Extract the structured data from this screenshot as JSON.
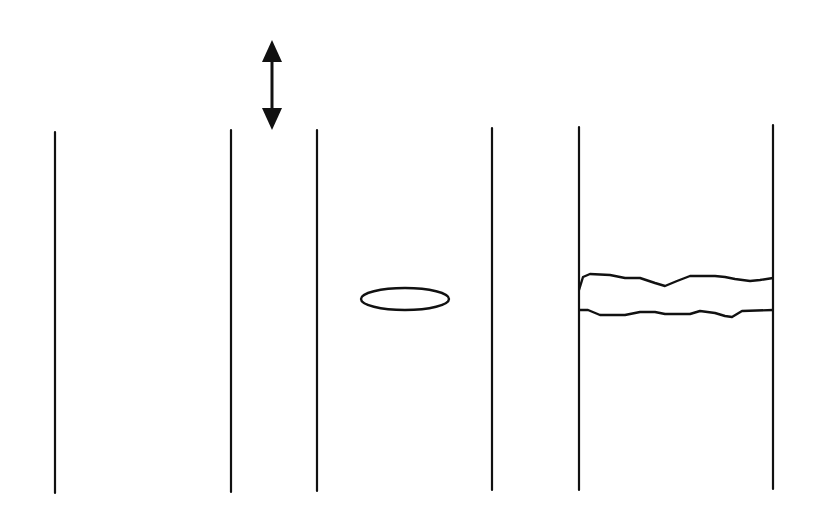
{
  "diagram": {
    "background": "#ffffff",
    "stroke_color": "#111111",
    "panels": [
      {
        "name": "panel-1",
        "left_line": {
          "x": 55,
          "y1": 132,
          "y2": 493
        },
        "right_line": {
          "x": 231,
          "y1": 130,
          "y2": 492
        },
        "feature": "none"
      },
      {
        "name": "panel-2",
        "left_line": {
          "x": 317,
          "y1": 130,
          "y2": 491
        },
        "right_line": {
          "x": 492,
          "y1": 128,
          "y2": 490
        },
        "feature": "ellipse",
        "ellipse": {
          "cx": 405,
          "cy": 299,
          "rx": 44,
          "ry": 11
        }
      },
      {
        "name": "panel-3",
        "left_line": {
          "x": 579,
          "y1": 127,
          "y2": 490
        },
        "right_line": {
          "x": 773,
          "y1": 125,
          "y2": 489
        },
        "feature": "wavy-band",
        "band": {
          "top_path": "M579,290 L583,277 L590,274 L610,275 L625,278 L640,278 L655,283 L665,286 L677,281 L690,276 L715,276 L725,277 L735,279 L750,281 L760,280 L773,278",
          "bottom_path": "M579,310 L588,310 L600,315 L625,315 L640,312 L655,312 L665,314 L690,314 L700,311 L715,313 L725,316 L732,317 L742,311 L773,310"
        }
      }
    ],
    "arrow": {
      "name": "double-headed-vertical-arrow",
      "x": 272,
      "y_top": 40,
      "y_bottom": 130,
      "head_length": 22,
      "head_half_width": 10
    }
  }
}
